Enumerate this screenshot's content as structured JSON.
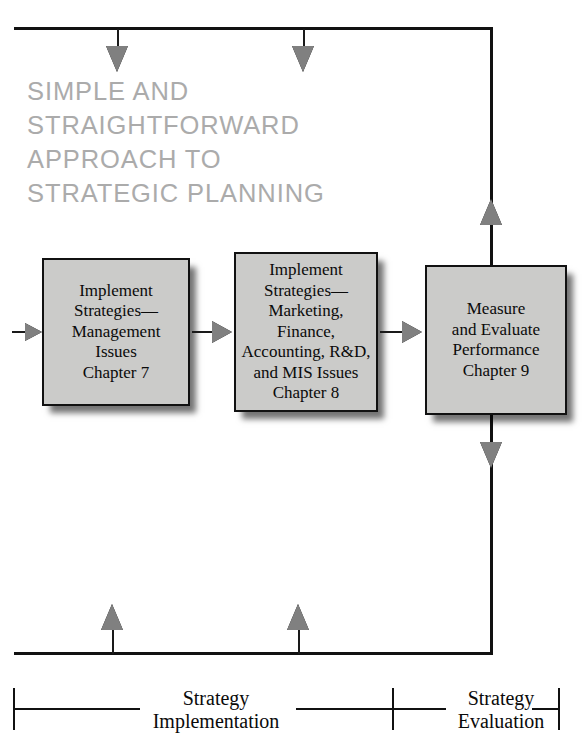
{
  "headline": {
    "text": "SIMPLE AND STRAIGHTFORWARD\nAPPROACH TO\nSTRATEGIC PLANNING",
    "color": "#ababab"
  },
  "boxes": [
    {
      "id": "implement-strategies-management",
      "text": "Implement\nStrategies—\nManagement\nIssues\nChapter 7",
      "fill": "#cbcbc9",
      "border": "#111111"
    },
    {
      "id": "implement-strategies-marketing",
      "text": "Implement\nStrategies—\nMarketing,\nFinance,\nAccounting, R&D,\nand MIS Issues\nChapter 8",
      "fill": "#cbcbc9",
      "border": "#111111"
    },
    {
      "id": "measure-and-evaluate",
      "text": "Measure\nand Evaluate\nPerformance\nChapter 9",
      "fill": "#cbcbc9",
      "border": "#111111"
    }
  ],
  "phases": [
    {
      "id": "strategy-implementation",
      "text": "Strategy\nImplementation"
    },
    {
      "id": "strategy-evaluation",
      "text": "Strategy\nEvaluation"
    }
  ],
  "arrows": {
    "feedback_top_label": "feedback-loop-top",
    "feedback_bottom_label": "feedback-loop-bottom",
    "arrow_fill": "#808080"
  }
}
